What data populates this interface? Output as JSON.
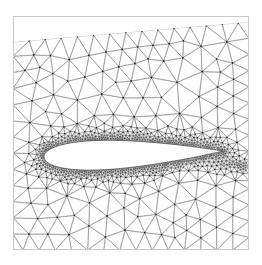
{
  "figure": {
    "title": "",
    "width": 262,
    "height": 265,
    "background_color": "#ffffff"
  },
  "chart_data": {
    "type": "diagram",
    "subtype": "unstructured-triangular-mesh",
    "title": "",
    "xlabel": "",
    "ylabel": "",
    "grid": false,
    "legend": null,
    "axes_visible": false,
    "tick_labels": [],
    "annotations": [],
    "frame": {
      "left": 13,
      "top": 16,
      "right": 249,
      "bottom": 250,
      "border_color": "#c8c8c8",
      "border_width": 1,
      "fill_color": "#ffffff"
    },
    "mesh": {
      "line_color": "#555555",
      "line_width": 0.35,
      "node_color": "#111111",
      "node_radius": 0.65,
      "node_draw_threshold": 0.55,
      "seed": 20240517,
      "relax_iterations": 22,
      "base_spacing": 15.5,
      "min_spacing": 1.45,
      "boundary_layer_spacing": 1.5,
      "far_field_spacing": 17.0
    },
    "top_cut": {
      "description": "Mesh domain top boundary is a slanted line leaving an empty white wedge in the upper-left of the frame.",
      "left_y": 42,
      "right_y": 22
    },
    "airfoil": {
      "name": "symmetric-airfoil",
      "leading_edge_x": 44,
      "trailing_edge_x": 223,
      "chord": 179,
      "camber_line_y_le": 157,
      "camber_line_y_te": 163,
      "max_thickness_ratio": 0.165,
      "max_thickness_position": 0.31,
      "surface_fill": "#ffffff",
      "surface_line_color": "#333333",
      "surface_line_width": 0.7,
      "angle_of_attack_deg": -1.9
    },
    "refinement_sources": [
      {
        "name": "leading-edge",
        "x": 44,
        "y": 157,
        "strength": 0.055,
        "radius": 30
      },
      {
        "name": "trailing-edge",
        "x": 223,
        "y": 163,
        "strength": 0.06,
        "radius": 34
      },
      {
        "name": "surface-band",
        "strength": 0.1,
        "radius": 26
      },
      {
        "name": "wake",
        "x0": 223,
        "y0": 163,
        "x1": 249,
        "y1": 166,
        "strength": 0.09,
        "radius": 16
      }
    ]
  }
}
